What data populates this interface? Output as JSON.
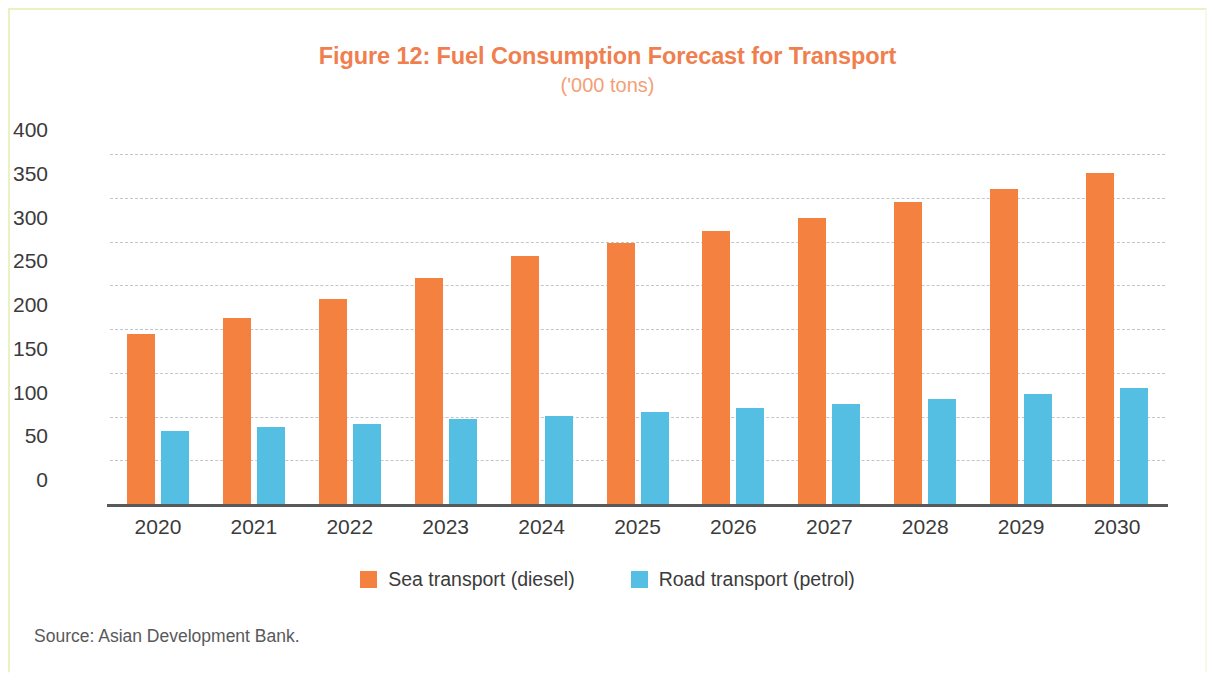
{
  "figure": {
    "title": "Figure 12: Fuel Consumption Forecast for Transport",
    "subtitle": "('000 tons)",
    "source": "Source: Asian Development Bank.",
    "title_color": "#f07f50",
    "subtitle_color": "#f3a077"
  },
  "legend": {
    "position": "bottom-center",
    "items": [
      {
        "label": "Sea transport (diesel)",
        "color": "#f4813f"
      },
      {
        "label": "Road transport (petrol)",
        "color": "#54bfe3"
      }
    ]
  },
  "chart_data": {
    "type": "bar",
    "title": "Figure 12: Fuel Consumption Forecast for Transport",
    "subtitle": "('000 tons)",
    "xlabel": "",
    "ylabel": "",
    "ylim": [
      0,
      400
    ],
    "yticks": [
      0,
      50,
      100,
      150,
      200,
      250,
      300,
      350,
      400
    ],
    "ytick_labels": [
      "0",
      "50",
      "100",
      "150",
      "200",
      "250",
      "300",
      "350",
      "400"
    ],
    "grid": true,
    "grid_style": "dashed-horizontal",
    "legend_position": "bottom-center",
    "categories": [
      "2020",
      "2021",
      "2022",
      "2023",
      "2024",
      "2025",
      "2026",
      "2027",
      "2028",
      "2029",
      "2030"
    ],
    "series": [
      {
        "name": "Sea transport (diesel)",
        "color": "#f4813f",
        "values": [
          196,
          214,
          236,
          259,
          285,
          299,
          313,
          328,
          346,
          361,
          380
        ]
      },
      {
        "name": "Road transport (petrol)",
        "color": "#54bfe3",
        "values": [
          85,
          89,
          93,
          98,
          102,
          106,
          111,
          116,
          121,
          127,
          134
        ]
      }
    ]
  }
}
